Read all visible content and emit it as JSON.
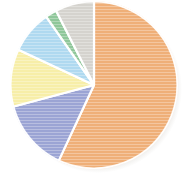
{
  "chart_data": {
    "type": "pie",
    "title": "",
    "subtitle": "",
    "xlabel": "",
    "ylabel": "",
    "legend_position": "none",
    "grid": false,
    "start_angle_deg": 0,
    "direction": "clockwise",
    "categories": [
      "Series 1",
      "Series 2",
      "Series 3",
      "Series 4",
      "Series 5",
      "Series 6"
    ],
    "values": [
      57,
      14,
      11,
      8,
      2,
      8
    ],
    "colors": [
      "#efaf78",
      "#9ba4d4",
      "#f7eea8",
      "#afd9f0",
      "#8fc79a",
      "#d5d3ce"
    ],
    "slices": [
      {
        "label": "Series 1",
        "value": 57,
        "percent": "57%",
        "color": "#efaf78",
        "start_deg": 0,
        "end_deg": 205
      },
      {
        "label": "Series 2",
        "value": 14,
        "percent": "14%",
        "color": "#9ba4d4",
        "start_deg": 205,
        "end_deg": 255
      },
      {
        "label": "Series 3",
        "value": 11,
        "percent": "11%",
        "color": "#f7eea8",
        "start_deg": 255,
        "end_deg": 295
      },
      {
        "label": "Series 4",
        "value": 8,
        "percent": "8%",
        "color": "#afd9f0",
        "start_deg": 295,
        "end_deg": 325
      },
      {
        "label": "Series 5",
        "value": 2,
        "percent": "2%",
        "color": "#8fc79a",
        "start_deg": 325,
        "end_deg": 333
      },
      {
        "label": "Series 6",
        "value": 8,
        "percent": "8%",
        "color": "#d5d3ce",
        "start_deg": 333,
        "end_deg": 360
      }
    ]
  },
  "figure": {
    "background": "#ffffff",
    "separator_color": "#ffffff",
    "shadow_color": "#c9c5bd",
    "center_x": 94,
    "center_y": 85,
    "radius": 84
  }
}
